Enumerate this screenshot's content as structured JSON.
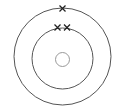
{
  "diagram": {
    "type": "atomic-shell-diagram",
    "center": [
      62,
      57
    ],
    "stroke_color": "#555555",
    "electron_color": "#222222",
    "nucleus": {
      "radius": 7,
      "cx": 62,
      "cy": 59,
      "stroke_color": "#999999"
    },
    "shells": [
      {
        "name": "inner-shell",
        "radius": 30.5,
        "electrons": 2,
        "electron_positions": [
          [
            57,
            27.5
          ],
          [
            67,
            27.5
          ]
        ]
      },
      {
        "name": "outer-shell",
        "radius": 48.5,
        "electrons": 1,
        "electron_positions": [
          [
            62,
            8.5
          ]
        ]
      }
    ],
    "electron_symbol": "×",
    "description": "Nucleus with two electron shells: 2 electrons in the inner shell, 1 in the outer shell"
  }
}
